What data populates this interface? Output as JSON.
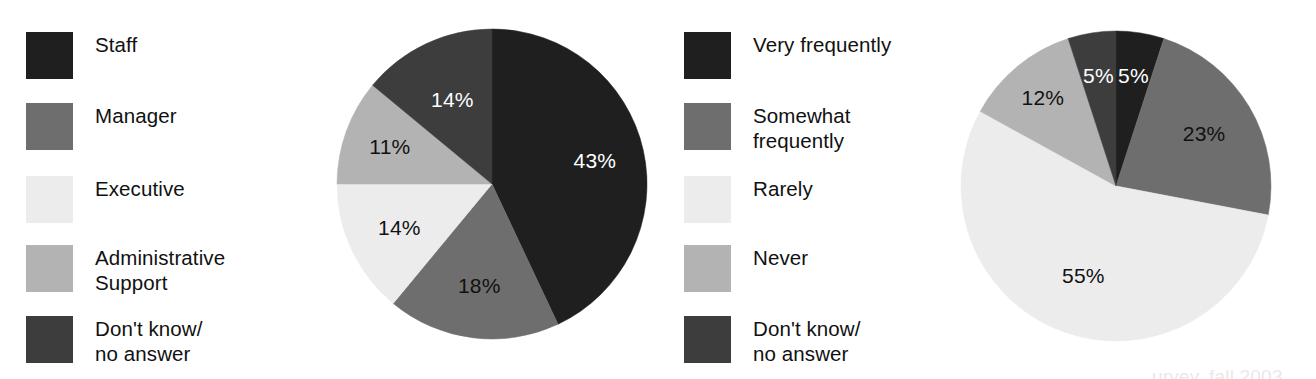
{
  "colors": {
    "background": "#ffffff",
    "text": "#111111",
    "label_light": "#ffffff",
    "series": {
      "black": "#1f1f1f",
      "medium_gray": "#6e6e6e",
      "very_light_gray": "#ececec",
      "light_gray": "#b3b3b3",
      "dark_gray": "#3d3d3d"
    }
  },
  "legend_left": {
    "name": "respondent-role-legend",
    "items": [
      {
        "label": "Staff",
        "color": "#1f1f1f"
      },
      {
        "label": "Manager",
        "color": "#6e6e6e"
      },
      {
        "label": "Executive",
        "color": "#ececec"
      },
      {
        "label": "Administrative\nSupport",
        "color": "#b3b3b3"
      },
      {
        "label": "Don't know/\nno answer",
        "color": "#3d3d3d"
      }
    ]
  },
  "legend_right": {
    "name": "frequency-legend",
    "items": [
      {
        "label": "Very frequently",
        "color": "#1f1f1f"
      },
      {
        "label": "Somewhat\nfrequently",
        "color": "#6e6e6e"
      },
      {
        "label": "Rarely",
        "color": "#ececec"
      },
      {
        "label": "Never",
        "color": "#b3b3b3"
      },
      {
        "label": "Don't know/\nno answer",
        "color": "#3d3d3d"
      }
    ]
  },
  "footnote": {
    "text": "urvey, fall 2003"
  },
  "chart_data": [
    {
      "type": "pie",
      "name": "respondent-role-pie",
      "title": "",
      "start_angle_deg": 0,
      "direction": "clockwise",
      "legend_position": "left",
      "categories": [
        "Staff",
        "Manager",
        "Executive",
        "Administrative Support",
        "Don't know/no answer"
      ],
      "values": [
        43,
        18,
        14,
        11,
        14
      ],
      "value_labels": [
        "43%",
        "18%",
        "14%",
        "11%",
        "14%"
      ],
      "colors": [
        "#1f1f1f",
        "#6e6e6e",
        "#ececec",
        "#b3b3b3",
        "#3d3d3d"
      ],
      "label_colors": [
        "#ffffff",
        "#111111",
        "#111111",
        "#111111",
        "#ffffff"
      ],
      "units": "percent"
    },
    {
      "type": "pie",
      "name": "usage-frequency-pie",
      "title": "",
      "start_angle_deg": 0,
      "direction": "clockwise",
      "legend_position": "left",
      "categories": [
        "Very frequently",
        "Somewhat frequently",
        "Rarely",
        "Never",
        "Don't know/no answer"
      ],
      "values": [
        5,
        23,
        55,
        12,
        5
      ],
      "value_labels": [
        "5%",
        "23%",
        "55%",
        "12%",
        "5%"
      ],
      "colors": [
        "#1f1f1f",
        "#6e6e6e",
        "#ececec",
        "#b3b3b3",
        "#3d3d3d"
      ],
      "label_colors": [
        "#ffffff",
        "#111111",
        "#111111",
        "#111111",
        "#ffffff"
      ],
      "units": "percent"
    }
  ]
}
